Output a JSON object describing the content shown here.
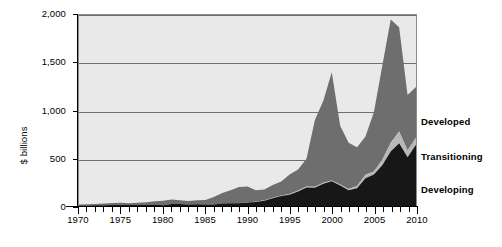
{
  "chart_data": {
    "type": "area",
    "stacked": true,
    "title": "",
    "subtitle": "",
    "xlabel": "",
    "ylabel": "$ billions",
    "xlim": [
      1970,
      2010
    ],
    "ylim": [
      0,
      2000
    ],
    "grid": true,
    "legend_position": "right",
    "y_ticks": [
      0,
      500,
      1000,
      1500,
      2000
    ],
    "y_tick_labels": [
      "0",
      "500",
      "1,000",
      "1,500",
      "2,000"
    ],
    "x_ticks": [
      1970,
      1975,
      1980,
      1985,
      1990,
      1995,
      2000,
      2005,
      2010
    ],
    "x_tick_labels": [
      "1970",
      "1975",
      "1980",
      "1985",
      "1990",
      "1995",
      "2000",
      "2005",
      "2010"
    ],
    "x_minor_tick_interval": 1,
    "x": [
      1970,
      1971,
      1972,
      1973,
      1974,
      1975,
      1976,
      1977,
      1978,
      1979,
      1980,
      1981,
      1982,
      1983,
      1984,
      1985,
      1986,
      1987,
      1988,
      1989,
      1990,
      1991,
      1992,
      1993,
      1994,
      1995,
      1996,
      1997,
      1998,
      1999,
      2000,
      2001,
      2002,
      2003,
      2004,
      2005,
      2006,
      2007,
      2008,
      2009,
      2010
    ],
    "series": [
      {
        "name": "Developing",
        "color": "#171717",
        "order": 1,
        "values": [
          5,
          6,
          7,
          9,
          10,
          12,
          10,
          11,
          13,
          15,
          8,
          20,
          20,
          17,
          19,
          15,
          17,
          25,
          30,
          30,
          36,
          43,
          55,
          80,
          105,
          117,
          152,
          193,
          191,
          232,
          258,
          215,
          164,
          186,
          290,
          329,
          427,
          571,
          658,
          511,
          642
        ]
      },
      {
        "name": "Transitioning",
        "color": "#b8b8b8",
        "order": 2,
        "values": [
          0,
          0,
          0,
          0,
          0,
          0,
          0,
          0,
          0,
          0,
          0,
          0,
          0,
          0,
          0,
          0,
          0,
          0,
          0,
          0,
          2,
          2,
          4,
          6,
          6,
          8,
          10,
          12,
          10,
          11,
          9,
          11,
          13,
          24,
          38,
          32,
          57,
          91,
          123,
          72,
          74
        ]
      },
      {
        "name": "Developed",
        "color": "#6e6e6e",
        "order": 3,
        "values": [
          10,
          12,
          14,
          18,
          21,
          22,
          20,
          22,
          26,
          34,
          46,
          48,
          40,
          35,
          41,
          47,
          78,
          110,
          135,
          170,
          165,
          120,
          115,
          135,
          145,
          205,
          220,
          290,
          700,
          860,
          1133,
          614,
          485,
          405,
          400,
          620,
          985,
          1290,
          1090,
          580,
          530
        ]
      }
    ],
    "totals_note": "",
    "annotations": []
  },
  "legend": {
    "items": [
      {
        "label": "Developed",
        "color": "#6e6e6e"
      },
      {
        "label": "Transitioning",
        "color": "#b8b8b8"
      },
      {
        "label": "Developing",
        "color": "#171717"
      }
    ]
  },
  "axes": {
    "y_title": "$ billions"
  }
}
